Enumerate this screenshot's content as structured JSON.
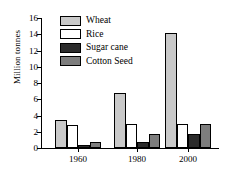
{
  "chart_data": {
    "type": "bar",
    "title": "",
    "xlabel": "",
    "ylabel": "Million tonnes",
    "categories": [
      "1960",
      "1980",
      "2000"
    ],
    "ylim": [
      0,
      16
    ],
    "yticks": [
      0,
      2,
      4,
      6,
      8,
      10,
      12,
      14,
      16
    ],
    "ytick_labels": [
      "0",
      "2",
      "4",
      "6",
      "8",
      "10",
      "12",
      "14",
      "16"
    ],
    "grid": false,
    "legend_position": "upper-left-inside",
    "series": [
      {
        "name": "Wheat",
        "color": "#c9c9c9",
        "values": [
          3.5,
          6.8,
          14.2
        ]
      },
      {
        "name": "Rice",
        "color": "#ffffff",
        "values": [
          2.8,
          3.0,
          3.0
        ]
      },
      {
        "name": "Sugar cane",
        "color": "#2b2b2b",
        "values": [
          0.4,
          0.8,
          1.7
        ]
      },
      {
        "name": "Cotton Seed",
        "color": "#7d7d7d",
        "values": [
          0.8,
          1.7,
          3.0
        ]
      }
    ]
  }
}
